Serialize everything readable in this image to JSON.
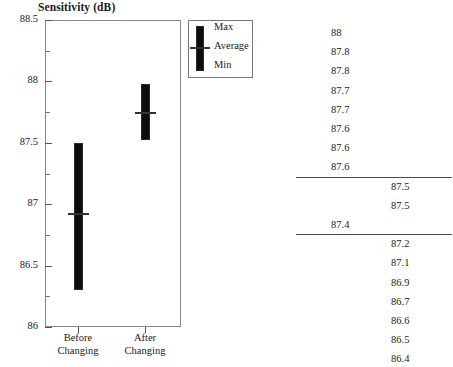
{
  "chart_data": {
    "type": "bar",
    "subtype": "range-min-max-average",
    "title": "Sensitivity (dB)",
    "xlabel": "",
    "ylabel": "Sensitivity (dB)",
    "ylim": [
      86,
      88.5
    ],
    "ytick_labels": [
      "88.5",
      "88",
      "87.5",
      "87",
      "86.5",
      "86"
    ],
    "ytick_values": [
      88.5,
      88,
      87.5,
      87,
      86.5,
      86
    ],
    "ytick_minor_values": [
      88.25,
      87.75,
      87.25,
      86.75,
      86.25
    ],
    "grid": false,
    "categories": [
      "Before Changing",
      "After Changing"
    ],
    "series": [
      {
        "name": "Max",
        "values": [
          87.5,
          87.98
        ]
      },
      {
        "name": "Average",
        "values": [
          86.93,
          87.75
        ]
      },
      {
        "name": "Min",
        "values": [
          86.3,
          87.52
        ]
      }
    ],
    "legend_position": "top-right",
    "legend_entries": [
      "Max",
      "Average",
      "Min"
    ],
    "bar_color": "#0d0d0d",
    "average_marker_color": "#333333"
  },
  "chart": {
    "title": "Sensitivity (dB)",
    "y_axis": {
      "ticks": [
        {
          "label": "88.5",
          "value": 88.5
        },
        {
          "label": "88",
          "value": 88
        },
        {
          "label": "87.5",
          "value": 87.5
        },
        {
          "label": "87",
          "value": 87
        },
        {
          "label": "86.5",
          "value": 86.5
        },
        {
          "label": "86",
          "value": 86
        }
      ]
    },
    "x_axis": {
      "categories": [
        {
          "line1": "Before",
          "line2": "Changing"
        },
        {
          "line1": "After",
          "line2": "Changing"
        }
      ]
    }
  },
  "legend": {
    "items": [
      {
        "label": "Max"
      },
      {
        "label": "Average"
      },
      {
        "label": "Min"
      }
    ]
  },
  "data_table": {
    "rows": [
      {
        "col_a": "88",
        "col_b": "",
        "rule_after": false
      },
      {
        "col_a": "87.8",
        "col_b": "",
        "rule_after": false
      },
      {
        "col_a": "87.8",
        "col_b": "",
        "rule_after": false
      },
      {
        "col_a": "87.7",
        "col_b": "",
        "rule_after": false
      },
      {
        "col_a": "87.7",
        "col_b": "",
        "rule_after": false
      },
      {
        "col_a": "87.6",
        "col_b": "",
        "rule_after": false
      },
      {
        "col_a": "87.6",
        "col_b": "",
        "rule_after": false
      },
      {
        "col_a": "87.6",
        "col_b": "",
        "rule_after": true
      },
      {
        "col_a": "",
        "col_b": "87.5",
        "rule_after": false
      },
      {
        "col_a": "",
        "col_b": "87.5",
        "rule_after": false
      },
      {
        "col_a": "87.4",
        "col_b": "",
        "rule_after": true
      },
      {
        "col_a": "",
        "col_b": "87.2",
        "rule_after": false
      },
      {
        "col_a": "",
        "col_b": "87.1",
        "rule_after": false
      },
      {
        "col_a": "",
        "col_b": "86.9",
        "rule_after": false
      },
      {
        "col_a": "",
        "col_b": "86.7",
        "rule_after": false
      },
      {
        "col_a": "",
        "col_b": "86.6",
        "rule_after": false
      },
      {
        "col_a": "",
        "col_b": "86.5",
        "rule_after": false
      },
      {
        "col_a": "",
        "col_b": "86.4",
        "rule_after": false
      }
    ]
  }
}
